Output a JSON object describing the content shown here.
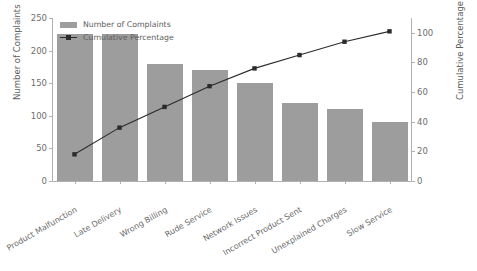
{
  "chart_data": {
    "type": "bar",
    "title": "",
    "subtitle": "",
    "categories": [
      "Product Malfunction",
      "Late Delivery",
      "Wrong Billing",
      "Rude Service",
      "Network Issues",
      "Incorrect Product Sent",
      "Unexplained Charges",
      "Slow Service"
    ],
    "series": [
      {
        "name": "Number of Complaints",
        "type": "bar",
        "axis": "left",
        "values": [
          225,
          225,
          180,
          170,
          150,
          120,
          110,
          90
        ],
        "color": "#9d9d9d"
      },
      {
        "name": "Cumulative Percentage",
        "type": "line",
        "axis": "right",
        "values": [
          18,
          36,
          50,
          64,
          76,
          85,
          94,
          101
        ],
        "color": "#2b2b2b"
      }
    ],
    "xlabel": "",
    "ylabel": "Number of Complaints",
    "ylabel_right": "Cumulative Percentage (%)",
    "ylim": [
      0,
      250
    ],
    "ylim_right": [
      0,
      110
    ],
    "yticks": [
      0,
      50,
      100,
      150,
      200,
      250
    ],
    "yticks_right": [
      0,
      20,
      40,
      60,
      80,
      100
    ],
    "grid": false,
    "legend_position": "upper-left"
  },
  "legend": {
    "bar_label": "Number of Complaints",
    "line_label": "Cumulative Percentage"
  },
  "axes": {
    "left_title": "Number of Complaints",
    "right_title": "Cumulative Percentage (%)"
  }
}
